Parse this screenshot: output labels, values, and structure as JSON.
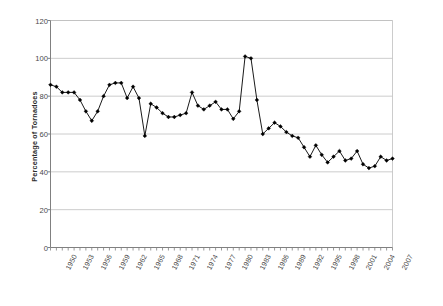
{
  "chart_data": {
    "type": "line",
    "title": "",
    "subtitle": "",
    "xlabel": "",
    "ylabel": "Percentage of Tornadoes",
    "ylim": [
      0,
      120
    ],
    "ytick_values": [
      0,
      20,
      40,
      60,
      80,
      100,
      120
    ],
    "ytick_labels": [
      "0",
      "20",
      "40",
      "60",
      "80",
      "100",
      "120"
    ],
    "grid": "horizontal",
    "legend": "none",
    "marker": "filled-diamond",
    "line_color": "#000000",
    "marker_color": "#000000",
    "gridline_color": "#bfbfbf",
    "axis_color": "#808080",
    "xlim": [
      1950,
      2008
    ],
    "xtick_labels": [
      "1950",
      "1953",
      "1956",
      "1959",
      "1962",
      "1965",
      "1968",
      "1971",
      "1974",
      "1977",
      "1980",
      "1983",
      "1986",
      "1989",
      "1992",
      "1995",
      "1998",
      "2001",
      "2004",
      "2007"
    ],
    "xtick_interval": 3,
    "x": [
      1950,
      1951,
      1952,
      1953,
      1954,
      1955,
      1956,
      1957,
      1958,
      1959,
      1960,
      1961,
      1962,
      1963,
      1964,
      1965,
      1966,
      1967,
      1968,
      1969,
      1970,
      1971,
      1972,
      1973,
      1974,
      1975,
      1976,
      1977,
      1978,
      1979,
      1980,
      1981,
      1982,
      1983,
      1984,
      1985,
      1986,
      1987,
      1988,
      1989,
      1990,
      1991,
      1992,
      1993,
      1994,
      1995,
      1996,
      1997,
      1998,
      1999,
      2000,
      2001,
      2002,
      2003,
      2004,
      2005,
      2006,
      2007,
      2008
    ],
    "values": [
      86,
      85,
      82,
      82,
      82,
      78,
      72,
      67,
      72,
      80,
      86,
      87,
      87,
      79,
      85,
      79,
      59,
      76,
      74,
      71,
      69,
      69,
      70,
      71,
      82,
      75,
      73,
      75,
      77,
      73,
      73,
      68,
      72,
      101,
      100,
      78,
      60,
      63,
      66,
      64,
      61,
      59,
      58,
      53,
      48,
      54,
      49,
      45,
      48,
      51,
      46,
      47,
      51,
      44,
      42,
      43,
      48,
      46,
      47
    ],
    "ylabel_rotated": true
  }
}
